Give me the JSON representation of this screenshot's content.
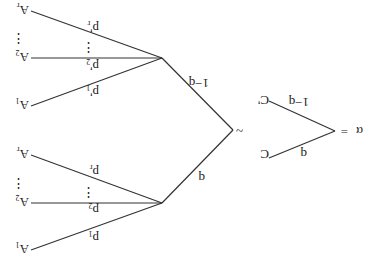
{
  "diagram": {
    "orientation": "rotated 180 degrees",
    "root": {
      "symbol": "α",
      "equals": "=",
      "branches": [
        {
          "prob": "q",
          "target": "C"
        },
        {
          "prob": "1−q",
          "target": "C'"
        }
      ]
    },
    "equivalence": "~",
    "compound": {
      "branches": [
        {
          "prob": "q",
          "leaves": [
            {
              "prob": "p",
              "sub": "1",
              "outcome": "A",
              "osub": "1"
            },
            {
              "prob": "p",
              "sub": "2",
              "outcome": "A",
              "osub": "2"
            },
            {
              "prob": "p",
              "sub": "r",
              "outcome": "A",
              "osub": "r"
            }
          ]
        },
        {
          "prob": "1−q",
          "leaves": [
            {
              "prob": "p'",
              "sub": "1",
              "outcome": "A",
              "osub": "1"
            },
            {
              "prob": "p'",
              "sub": "2",
              "outcome": "A",
              "osub": "2"
            },
            {
              "prob": "p'",
              "sub": "r",
              "outcome": "A",
              "osub": "r"
            }
          ]
        }
      ]
    },
    "ellipsis": "⋮"
  }
}
